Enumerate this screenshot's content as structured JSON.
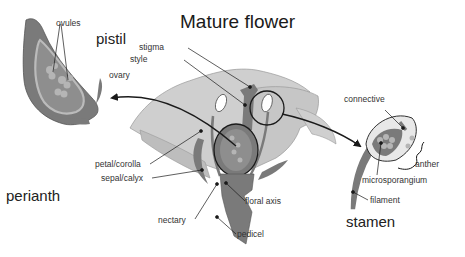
{
  "title": "Mature flower",
  "group_labels": {
    "pistil": "pistil",
    "perianth": "perianth",
    "stamen": "stamen"
  },
  "labels": {
    "ovules": "ovules",
    "ovary": "ovary",
    "stigma": "stigma",
    "style": "style",
    "petal_corolla": "petal/corolla",
    "sepal_calyx": "sepal/calyx",
    "nectary": "nectary",
    "floral_axis": "floral axis",
    "pedicel": "pedicel",
    "connective": "connective",
    "anther": "anther",
    "microsporangium": "microsporangium",
    "filament": "filament"
  },
  "colors": {
    "petal_light": "#cfcfcf",
    "petal_mid": "#bdbdbd",
    "dark_tissue": "#7a7a7a",
    "ovary_inner": "#8e8e8e",
    "ovule": "#b5b5b5",
    "line": "#1a1a1a"
  }
}
